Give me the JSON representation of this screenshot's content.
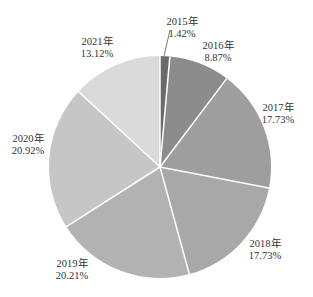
{
  "chart_data": {
    "type": "pie",
    "title": "",
    "center": [
      160,
      167
    ],
    "radius": 111,
    "start_angle_deg": 0,
    "direction": "clockwise",
    "slices": [
      {
        "label": "2015年",
        "value": 1.42,
        "value_label": "1.42%",
        "color": "#6a6a6a"
      },
      {
        "label": "2016年",
        "value": 8.87,
        "value_label": "8.87%",
        "color": "#8c8c8c"
      },
      {
        "label": "2017年",
        "value": 17.73,
        "value_label": "17.73%",
        "color": "#9e9e9e"
      },
      {
        "label": "2018年",
        "value": 17.73,
        "value_label": "17.73%",
        "color": "#a8a8a8"
      },
      {
        "label": "2019年",
        "value": 20.21,
        "value_label": "20.21%",
        "color": "#b2b2b2"
      },
      {
        "label": "2020年",
        "value": 20.92,
        "value_label": "20.92%",
        "color": "#c6c6c6"
      },
      {
        "label": "2021年",
        "value": 13.12,
        "value_label": "13.12%",
        "color": "#dadada"
      }
    ],
    "labels_pos": [
      {
        "x": 182,
        "y": 16
      },
      {
        "x": 218,
        "y": 40
      },
      {
        "x": 278,
        "y": 102
      },
      {
        "x": 265,
        "y": 238
      },
      {
        "x": 72,
        "y": 258
      },
      {
        "x": 28,
        "y": 133
      },
      {
        "x": 97,
        "y": 36
      }
    ]
  }
}
